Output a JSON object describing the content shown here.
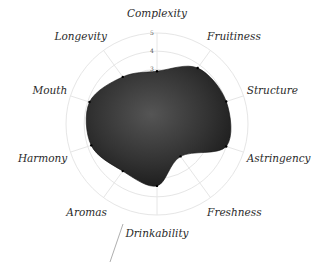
{
  "chart_data": {
    "type": "radar",
    "title": "",
    "categories": [
      "Complexity",
      "Fruitiness",
      "Structure",
      "Astringency",
      "Freshness",
      "Drinkability",
      "Aromas",
      "Harmony",
      "Mouth",
      "Longevity"
    ],
    "series": [
      {
        "name": "Wine profile",
        "values": [
          2.9,
          3.8,
          4.0,
          4.0,
          2.2,
          3.4,
          3.2,
          3.8,
          3.9,
          3.2
        ],
        "color": "#2b2b2b"
      }
    ],
    "rlim": [
      0,
      5
    ],
    "r_ticks": [
      3,
      4,
      5
    ],
    "grid": true,
    "legend": "none"
  },
  "colors": {
    "fill": "#2b2b2b",
    "grid": "#e6e6e6",
    "label": "#2a2a2a"
  }
}
